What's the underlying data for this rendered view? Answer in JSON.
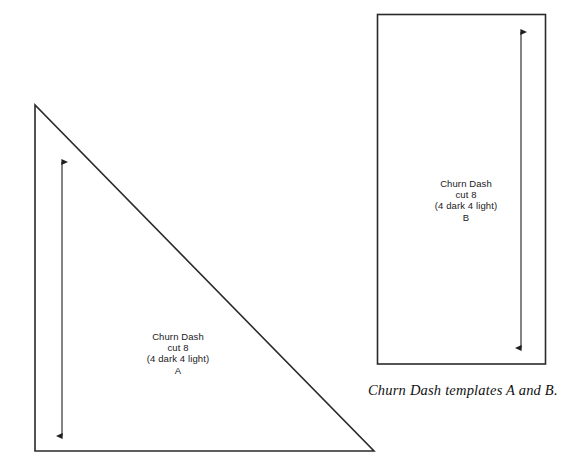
{
  "page": {
    "background_color": "#ffffff",
    "line_color": "#2a2a2a",
    "text_color": "#1a1a1a"
  },
  "templates": [
    {
      "id": "A",
      "shape": "right-triangle",
      "label_lines": {
        "line1": "Churn Dash",
        "line2": "cut 8",
        "line3": "(4 dark 4 light)",
        "line4": "A"
      },
      "grain_arrow": {
        "direction": "double-headed-vertical"
      }
    },
    {
      "id": "B",
      "shape": "rectangle",
      "label_lines": {
        "line1": "Churn Dash",
        "line2": "cut 8",
        "line3": "(4 dark 4 light)",
        "line4": "B"
      },
      "grain_arrow": {
        "direction": "double-headed-vertical"
      }
    }
  ],
  "caption": "Churn Dash templates A and B."
}
